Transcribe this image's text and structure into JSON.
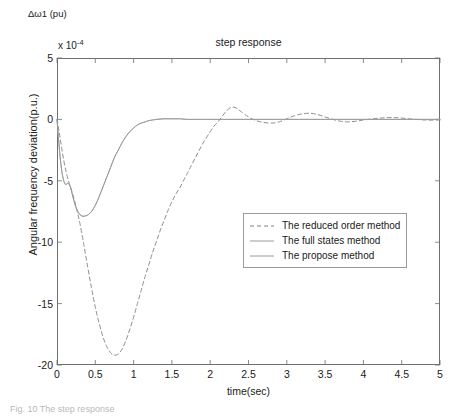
{
  "figure": {
    "axis_annotation": "Δω1 (pu)",
    "caption": "Fig. 10 The step response",
    "exponent_prefix": "x 10",
    "exponent_power": "-4",
    "background_color": "#ffffff",
    "axis_color": "#6f6f6f"
  },
  "chart_data": {
    "type": "line",
    "title": "step response",
    "xlabel": "time(sec)",
    "ylabel": "Angular frequency deviation(p.u.)",
    "y_multiplier": "x 10^-4",
    "xlim": [
      0,
      5
    ],
    "ylim": [
      -20,
      5
    ],
    "xticks": [
      "0",
      "0.5",
      "1",
      "1.5",
      "2",
      "2.5",
      "3",
      "3.5",
      "4",
      "4.5",
      "5"
    ],
    "xtick_values": [
      0,
      0.5,
      1,
      1.5,
      2,
      2.5,
      3,
      3.5,
      4,
      4.5,
      5
    ],
    "yticks": [
      "5",
      "0",
      "-5",
      "-10",
      "-15",
      "-20"
    ],
    "ytick_values": [
      5,
      0,
      -5,
      -10,
      -15,
      -20
    ],
    "grid": false,
    "legend_position": "center-right",
    "series": [
      {
        "name": "The reduced order method",
        "style": "dashed",
        "color": "#808080",
        "x": [
          0,
          0.03,
          0.06,
          0.09,
          0.12,
          0.15,
          0.18,
          0.22,
          0.26,
          0.3,
          0.35,
          0.4,
          0.45,
          0.5,
          0.55,
          0.6,
          0.65,
          0.7,
          0.75,
          0.8,
          0.85,
          0.9,
          0.95,
          1.0,
          1.05,
          1.1,
          1.15,
          1.2,
          1.25,
          1.3,
          1.35,
          1.4,
          1.45,
          1.5,
          1.55,
          1.6,
          1.65,
          1.7,
          1.75,
          1.8,
          1.85,
          1.9,
          1.95,
          2.0,
          2.05,
          2.1,
          2.15,
          2.2,
          2.25,
          2.3,
          2.35,
          2.4,
          2.5,
          2.6,
          2.7,
          2.8,
          2.9,
          3.0,
          3.1,
          3.2,
          3.3,
          3.4,
          3.5,
          3.6,
          3.7,
          3.8,
          3.9,
          4.0,
          4.2,
          4.4,
          4.6,
          4.8,
          5.0
        ],
        "y": [
          0,
          -1.1,
          -2.3,
          -3.4,
          -4.3,
          -5.0,
          -5.6,
          -6.4,
          -7.4,
          -8.5,
          -10.2,
          -12.0,
          -13.7,
          -15.3,
          -16.6,
          -17.7,
          -18.5,
          -19.0,
          -19.2,
          -19.1,
          -18.7,
          -18.0,
          -17.1,
          -16.1,
          -15.0,
          -13.9,
          -12.8,
          -11.8,
          -10.8,
          -9.9,
          -9.0,
          -8.2,
          -7.4,
          -6.7,
          -6.1,
          -5.6,
          -5.0,
          -4.4,
          -3.8,
          -3.2,
          -2.6,
          -2.0,
          -1.5,
          -1.0,
          -0.55,
          -0.2,
          0.2,
          0.6,
          0.9,
          1.0,
          0.9,
          0.65,
          0.2,
          -0.1,
          -0.25,
          -0.3,
          -0.2,
          0.05,
          0.3,
          0.45,
          0.5,
          0.4,
          0.2,
          0.0,
          -0.15,
          -0.2,
          -0.15,
          -0.05,
          0.1,
          0.15,
          0.05,
          -0.05,
          -0.05
        ]
      },
      {
        "name": "The full states method",
        "style": "solid",
        "color": "#9a9a9a",
        "x": [
          0,
          0.02,
          0.04,
          0.06,
          0.08,
          0.1,
          0.12,
          0.14,
          0.16,
          0.18,
          0.2,
          0.22,
          0.25,
          0.28,
          0.31,
          0.34,
          0.37,
          0.4,
          0.45,
          0.5,
          0.55,
          0.6,
          0.65,
          0.7,
          0.75,
          0.8,
          0.85,
          0.9,
          0.95,
          1.0,
          1.05,
          1.1,
          1.15,
          1.2,
          1.3,
          1.4,
          1.5,
          1.6,
          1.7,
          1.8,
          1.9,
          2.0,
          2.2,
          2.4,
          2.6,
          2.8,
          3.0,
          3.5,
          4.0,
          4.5,
          5.0
        ],
        "y": [
          0,
          -1.6,
          -3.0,
          -4.1,
          -4.8,
          -5.2,
          -5.3,
          -5.2,
          -5.3,
          -5.6,
          -6.1,
          -6.6,
          -7.2,
          -7.6,
          -7.8,
          -7.9,
          -7.85,
          -7.8,
          -7.5,
          -7.0,
          -6.3,
          -5.5,
          -4.7,
          -3.9,
          -3.1,
          -2.5,
          -1.9,
          -1.4,
          -1.0,
          -0.7,
          -0.45,
          -0.3,
          -0.2,
          -0.1,
          0.0,
          0.05,
          0.05,
          0.05,
          0.0,
          0.0,
          0.0,
          0.0,
          0.0,
          0.0,
          0.0,
          0.0,
          0.0,
          0.0,
          0.0,
          0.0,
          0.0
        ]
      },
      {
        "name": "The propose method",
        "style": "solid",
        "color": "#9a9a9a",
        "x": [
          0,
          0.02,
          0.04,
          0.06,
          0.08,
          0.1,
          0.12,
          0.14,
          0.16,
          0.18,
          0.2,
          0.22,
          0.25,
          0.28,
          0.31,
          0.34,
          0.37,
          0.4,
          0.45,
          0.5,
          0.55,
          0.6,
          0.65,
          0.7,
          0.75,
          0.8,
          0.85,
          0.9,
          0.95,
          1.0,
          1.05,
          1.1,
          1.15,
          1.2,
          1.3,
          1.4,
          1.5,
          1.6,
          1.7,
          1.8,
          1.9,
          2.0,
          2.2,
          2.4,
          2.6,
          2.8,
          3.0,
          3.5,
          4.0,
          4.5,
          5.0
        ],
        "y": [
          0,
          -1.6,
          -3.0,
          -4.1,
          -4.8,
          -5.2,
          -5.3,
          -5.2,
          -5.3,
          -5.6,
          -6.1,
          -6.6,
          -7.2,
          -7.6,
          -7.8,
          -7.9,
          -7.85,
          -7.8,
          -7.5,
          -7.0,
          -6.3,
          -5.5,
          -4.7,
          -3.9,
          -3.1,
          -2.5,
          -1.9,
          -1.4,
          -1.0,
          -0.7,
          -0.45,
          -0.3,
          -0.2,
          -0.1,
          0.0,
          0.05,
          0.05,
          0.05,
          0.0,
          0.0,
          0.0,
          0.0,
          0.0,
          0.0,
          0.0,
          0.0,
          0.0,
          0.0,
          0.0,
          0.0,
          0.0
        ]
      }
    ]
  },
  "legend": {
    "items": [
      {
        "label": "The reduced order method",
        "style": "dashed"
      },
      {
        "label": "The full states method",
        "style": "solid"
      },
      {
        "label": "The propose method",
        "style": "solid"
      }
    ]
  }
}
